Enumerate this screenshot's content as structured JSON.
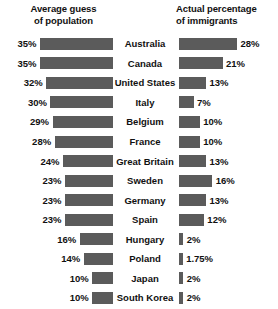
{
  "chart_data": {
    "type": "bar",
    "title": "",
    "subtitle": "",
    "orientation": "horizontal-diverging",
    "grid": false,
    "legend_position": "top",
    "xlabel": "",
    "ylabel": "",
    "categories": [
      "Australia",
      "Canada",
      "United States",
      "Italy",
      "Belgium",
      "France",
      "Great Britain",
      "Sweden",
      "Germany",
      "Spain",
      "Hungary",
      "Poland",
      "Japan",
      "South Korea"
    ],
    "series": [
      {
        "name": "Average guess of population",
        "side": "left",
        "unit": "%",
        "values": [
          35,
          35,
          32,
          30,
          29,
          28,
          24,
          23,
          23,
          23,
          16,
          14,
          10,
          10
        ],
        "labels": [
          "35%",
          "35%",
          "32%",
          "30%",
          "29%",
          "28%",
          "24%",
          "23%",
          "23%",
          "23%",
          "16%",
          "14%",
          "10%",
          "10%"
        ]
      },
      {
        "name": "Actual percentage of immigrants",
        "side": "right",
        "unit": "%",
        "values": [
          28,
          21,
          13,
          7,
          10,
          10,
          13,
          16,
          13,
          12,
          2,
          1.75,
          2,
          2
        ],
        "labels": [
          "28%",
          "21%",
          "13%",
          "7%",
          "10%",
          "10%",
          "13%",
          "16%",
          "13%",
          "12%",
          "2%",
          "1.75%",
          "2%",
          "2%"
        ]
      }
    ],
    "xlim_left": [
      0,
      35
    ],
    "xlim_right": [
      0,
      28
    ],
    "bar_color": "#5b5b5b",
    "background_color": "#ffffff"
  },
  "headers": {
    "left_line1": "Average guess",
    "left_line2": "of population",
    "right_line1": "Actual percentage",
    "right_line2": "of immigrants"
  }
}
